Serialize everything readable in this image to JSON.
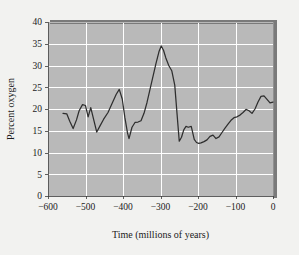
{
  "chart_data": {
    "type": "line",
    "title": "",
    "xlabel": "Time (millions of years)",
    "ylabel": "Percent oxygen",
    "xlim": [
      -600,
      0
    ],
    "ylim": [
      0,
      40
    ],
    "xticks": [
      -600,
      -500,
      -400,
      -300,
      -200,
      -100,
      0
    ],
    "xtick_labels": [
      "−600",
      "−500",
      "−400",
      "−300",
      "−200",
      "−100",
      "0"
    ],
    "yticks": [
      0,
      5,
      10,
      15,
      20,
      25,
      30,
      35,
      40
    ],
    "ytick_labels": [
      "0",
      "5",
      "10",
      "15",
      "20",
      "25",
      "30",
      "35",
      "40"
    ],
    "grid": true,
    "grid_color": "#ffffff",
    "plot_background": "#b9b9b9",
    "figure_background": "#f2f2f0",
    "line_color": "#2e2e2e",
    "legend": null,
    "series": [
      {
        "name": "Atmospheric oxygen",
        "x": [
          -560,
          -550,
          -542,
          -533,
          -524,
          -517,
          -508,
          -500,
          -493,
          -486,
          -478,
          -470,
          -462,
          -452,
          -440,
          -428,
          -418,
          -410,
          -402,
          -395,
          -388,
          -384,
          -376,
          -368,
          -360,
          -352,
          -344,
          -336,
          -328,
          -320,
          -312,
          -304,
          -298,
          -292,
          -286,
          -278,
          -270,
          -262,
          -256,
          -250,
          -244,
          -238,
          -232,
          -226,
          -218,
          -210,
          -204,
          -198,
          -192,
          -184,
          -176,
          -168,
          -160,
          -152,
          -144,
          -136,
          -128,
          -120,
          -112,
          -104,
          -96,
          -88,
          -80,
          -72,
          -64,
          -56,
          -48,
          -40,
          -32,
          -24,
          -16,
          -8,
          0
        ],
        "y": [
          19.0,
          18.9,
          17.2,
          15.5,
          17.5,
          19.6,
          21.0,
          20.8,
          18.2,
          20.3,
          17.5,
          14.7,
          16.0,
          17.6,
          19.2,
          21.5,
          23.4,
          24.5,
          22.3,
          18.0,
          14.5,
          13.2,
          15.8,
          16.9,
          17.0,
          17.3,
          19.0,
          21.5,
          24.5,
          27.5,
          30.5,
          33.2,
          34.5,
          33.5,
          31.8,
          30.0,
          28.8,
          25.5,
          19.0,
          12.6,
          13.5,
          15.2,
          16.0,
          15.8,
          16.0,
          13.0,
          12.3,
          12.1,
          12.2,
          12.5,
          12.9,
          13.7,
          14.0,
          13.2,
          13.6,
          14.6,
          15.6,
          16.5,
          17.4,
          18.0,
          18.2,
          18.6,
          19.2,
          19.9,
          19.6,
          19.0,
          20.0,
          21.6,
          22.9,
          23.0,
          22.2,
          21.4,
          21.6
        ]
      }
    ]
  },
  "layout": {
    "plot_left": 48,
    "plot_right": 273,
    "plot_top": 22,
    "plot_bottom": 196
  }
}
